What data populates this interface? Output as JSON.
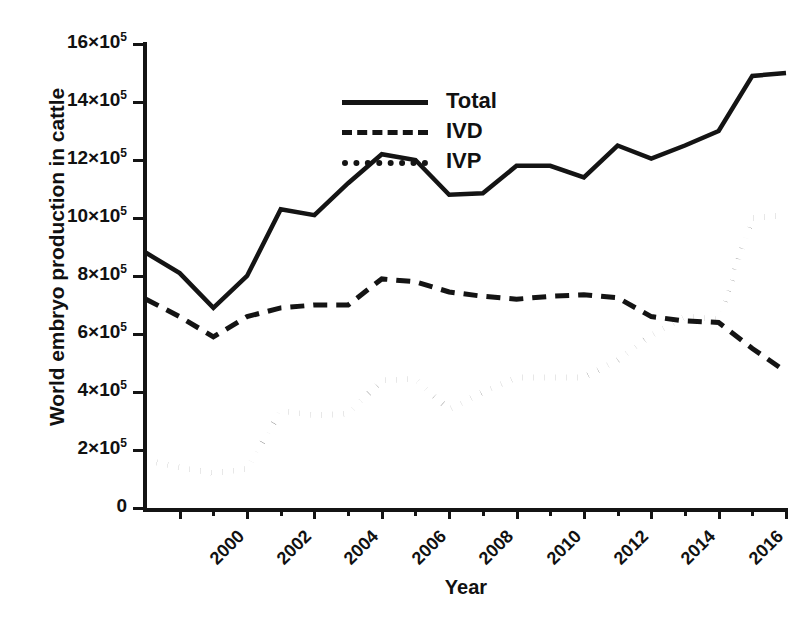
{
  "chart_data": {
    "type": "line",
    "title": "",
    "xlabel": "Year",
    "ylabel": "World embryo production in cattle",
    "grid": false,
    "legend_position": "top-left-inside",
    "xlim": [
      1999,
      2018
    ],
    "ylim": [
      0,
      1600000
    ],
    "y_tick_values": [
      0,
      200000,
      400000,
      600000,
      800000,
      1000000,
      1200000,
      1400000,
      1600000
    ],
    "y_tick_labels": [
      "0",
      "2×10⁵",
      "4×10⁵",
      "6×10⁵",
      "8×10⁵",
      "10×10⁵",
      "12×10⁵",
      "14×10⁵",
      "16×10⁵"
    ],
    "y_tick_mantissas": [
      "0",
      "2",
      "4",
      "6",
      "8",
      "10",
      "12",
      "14",
      "16"
    ],
    "x_tick_values": [
      2000,
      2002,
      2004,
      2006,
      2008,
      2010,
      2012,
      2014,
      2016,
      2018
    ],
    "x_tick_labels": [
      "2000",
      "2002",
      "2004",
      "2006",
      "2008",
      "2010",
      "2012",
      "2014",
      "2016",
      "2018"
    ],
    "x_minor_ticks": [
      2001,
      2003,
      2005,
      2007,
      2009,
      2011,
      2013,
      2015,
      2017
    ],
    "x": [
      1999,
      2000,
      2001,
      2002,
      2003,
      2004,
      2005,
      2006,
      2007,
      2008,
      2009,
      2010,
      2011,
      2012,
      2013,
      2014,
      2015,
      2016,
      2017,
      2018
    ],
    "series": [
      {
        "name": "Total",
        "style": "solid",
        "color": "#141414",
        "values": [
          880000,
          810000,
          690000,
          800000,
          1030000,
          1010000,
          1120000,
          1220000,
          1200000,
          1080000,
          1085000,
          1180000,
          1180000,
          1140000,
          1250000,
          1205000,
          1250000,
          1300000,
          1490000,
          1500000
        ]
      },
      {
        "name": "IVD",
        "style": "dashed",
        "color": "#141414",
        "values": [
          720000,
          660000,
          590000,
          660000,
          690000,
          700000,
          700000,
          790000,
          780000,
          745000,
          730000,
          720000,
          730000,
          735000,
          725000,
          660000,
          645000,
          640000,
          550000,
          470000
        ]
      },
      {
        "name": "IVP",
        "style": "dotted",
        "color": "#141414",
        "values": [
          165000,
          140000,
          120000,
          135000,
          335000,
          320000,
          325000,
          440000,
          445000,
          340000,
          400000,
          450000,
          450000,
          450000,
          510000,
          595000,
          660000,
          650000,
          1000000,
          1010000
        ]
      }
    ]
  },
  "legend": {
    "items": [
      {
        "label": "Total",
        "style": "solid"
      },
      {
        "label": "IVD",
        "style": "dashed"
      },
      {
        "label": "IVP",
        "style": "dotted"
      }
    ]
  }
}
